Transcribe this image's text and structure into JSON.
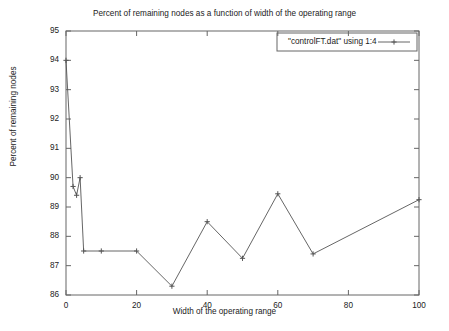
{
  "chart_data": {
    "type": "line",
    "title": "Percent of remaining nodes as a function of width of the operating range",
    "xlabel": "Width of the operating range",
    "ylabel": "Percent of remaining nodes",
    "xlim": [
      0,
      100
    ],
    "ylim": [
      86,
      95
    ],
    "xticks": [
      0,
      20,
      40,
      60,
      80,
      100
    ],
    "yticks": [
      86,
      87,
      88,
      89,
      90,
      91,
      92,
      93,
      94,
      95
    ],
    "xtick_labels": [
      "0",
      "20",
      "40",
      "60",
      "80",
      "100"
    ],
    "ytick_labels": [
      "86",
      "87",
      "88",
      "89",
      "90",
      "91",
      "92",
      "93",
      "94",
      "95"
    ],
    "grid": false,
    "legend_position": "top-right",
    "marker": "plus",
    "line_color": "#555555",
    "series": [
      {
        "name": "\"controlFT.dat\" using 1:4",
        "x": [
          0,
          2,
          3,
          4,
          5,
          10,
          20,
          30,
          40,
          50,
          60,
          70,
          100
        ],
        "values": [
          94.0,
          89.7,
          89.4,
          90.0,
          87.5,
          87.5,
          87.5,
          86.3,
          88.5,
          87.25,
          89.45,
          87.4,
          89.25
        ]
      }
    ]
  },
  "legend": {
    "entry_label": "\"controlFT.dat\" using 1:4"
  },
  "colors": {
    "line": "#555555",
    "axis": "#666666",
    "text": "#222222",
    "background": "#ffffff"
  }
}
